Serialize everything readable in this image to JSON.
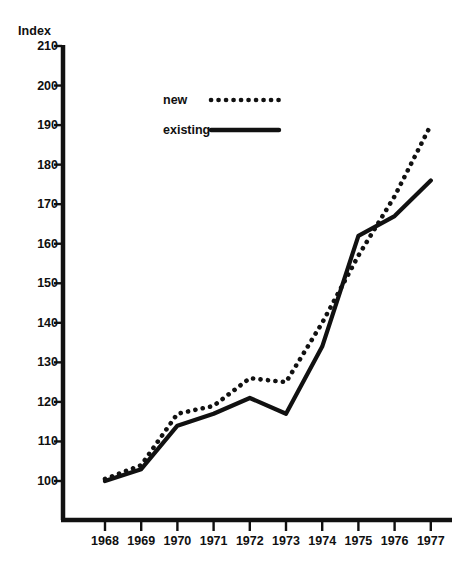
{
  "chart_data": {
    "type": "line",
    "title": "",
    "ylabel": "Index",
    "xlabel": "",
    "ylim": [
      95,
      210
    ],
    "xlim": [
      1968,
      1977
    ],
    "grid": false,
    "legend_position": "top-center",
    "categories": [
      1968,
      1969,
      1970,
      1971,
      1972,
      1973,
      1974,
      1975,
      1976,
      1977
    ],
    "yticks": [
      100,
      110,
      120,
      130,
      140,
      150,
      160,
      170,
      180,
      190,
      200,
      210
    ],
    "xticks": [
      "1968",
      "1969",
      "1970",
      "1971",
      "1972",
      "1973",
      "1974",
      "1975",
      "1976",
      "1977"
    ],
    "series": [
      {
        "name": "new",
        "style": "dotted",
        "color": "#111111",
        "values": [
          100.5,
          104,
          117,
          119,
          126,
          125,
          140,
          157,
          172,
          190
        ]
      },
      {
        "name": "existing",
        "style": "solid",
        "color": "#111111",
        "values": [
          100,
          103,
          114,
          117,
          121,
          117,
          134,
          162,
          167,
          176
        ]
      }
    ]
  },
  "axis": {
    "y_title": "Index",
    "y_tick_labels": [
      "210",
      "200",
      "190",
      "180",
      "170",
      "160",
      "150",
      "140",
      "130",
      "120",
      "110",
      "100"
    ],
    "x_tick_labels": [
      "1968",
      "1969",
      "1970",
      "1971",
      "1972",
      "1973",
      "1974",
      "1975",
      "1976",
      "1977"
    ]
  },
  "legend": {
    "entries": [
      {
        "label": "new",
        "style": "dotted"
      },
      {
        "label": "existing",
        "style": "solid"
      }
    ]
  },
  "colors": {
    "ink": "#111111",
    "background": "#ffffff"
  }
}
